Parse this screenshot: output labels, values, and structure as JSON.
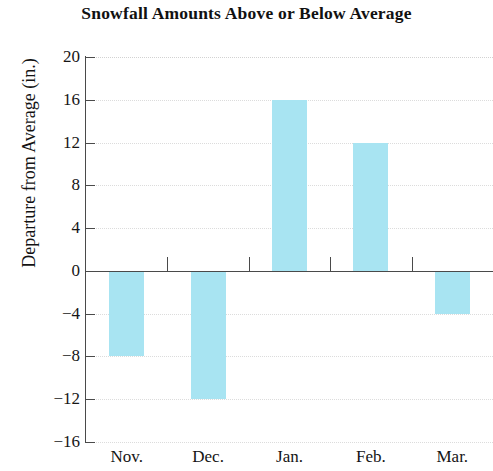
{
  "chart_data": {
    "type": "bar",
    "title": "Snowfall Amounts Above or Below Average",
    "xlabel": "",
    "ylabel": "Departure from Average (in.)",
    "categories": [
      "Nov.",
      "Dec.",
      "Jan.",
      "Feb.",
      "Mar."
    ],
    "values": [
      -8,
      -12,
      16,
      12,
      -4
    ],
    "ylim": [
      -16,
      20
    ],
    "ytick_values": [
      20,
      16,
      12,
      8,
      4,
      0,
      -4,
      -8,
      -12,
      -16
    ],
    "ytick_labels": [
      "20",
      "16",
      "12",
      "8",
      "4",
      "0",
      "−4",
      "−8",
      "−12",
      "−16"
    ],
    "ytick_step": 4,
    "grid": true,
    "grid_axis": "y",
    "legend": null,
    "bar_color": "#a8e4f2",
    "axis_color": "#4a4a4a",
    "grid_color": "#dcdcdc",
    "zero_line": 0,
    "series": [
      {
        "name": "Departure from Average (in.)",
        "values": [
          -8,
          -12,
          16,
          12,
          -4
        ]
      }
    ],
    "points": [
      {
        "category": "Nov.",
        "value": -8
      },
      {
        "category": "Dec.",
        "value": -12
      },
      {
        "category": "Jan.",
        "value": 16
      },
      {
        "category": "Feb.",
        "value": 12
      },
      {
        "category": "Mar.",
        "value": -4
      }
    ]
  }
}
